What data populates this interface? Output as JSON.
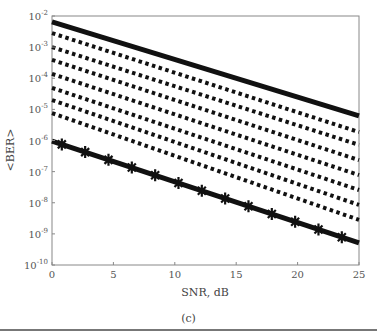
{
  "chart_data": {
    "type": "line",
    "title": "",
    "xlabel": "SNR, dB",
    "ylabel": "<BER>",
    "caption": "(c)",
    "xlim": [
      0,
      25
    ],
    "ylim": [
      1e-10,
      0.01
    ],
    "yscale": "log",
    "grid": false,
    "legend": null,
    "x_ticks": [
      0,
      5,
      10,
      15,
      20,
      25
    ],
    "y_ticks": [
      "10^-2",
      "10^-3",
      "10^-4",
      "10^-5",
      "10^-6",
      "10^-7",
      "10^-8",
      "10^-9",
      "10^-10"
    ],
    "x": [
      0,
      25
    ],
    "series": [
      {
        "name": "curve-1 (solid, top)",
        "style": "solid",
        "log10_values": [
          -2.19,
          -5.21
        ]
      },
      {
        "name": "curve-2 (dotted)",
        "style": "dotted",
        "log10_values": [
          -2.55,
          -5.73
        ]
      },
      {
        "name": "curve-3 (dotted)",
        "style": "dotted",
        "log10_values": [
          -3.0,
          -6.14
        ]
      },
      {
        "name": "curve-4 (dotted)",
        "style": "dotted",
        "log10_values": [
          -3.41,
          -6.63
        ]
      },
      {
        "name": "curve-5 (dotted)",
        "style": "dotted",
        "log10_values": [
          -3.86,
          -7.11
        ]
      },
      {
        "name": "curve-6 (dotted)",
        "style": "dotted",
        "log10_values": [
          -4.31,
          -7.59
        ]
      },
      {
        "name": "curve-7 (dotted)",
        "style": "dotted",
        "log10_values": [
          -4.7,
          -8.07
        ]
      },
      {
        "name": "curve-8 (dotted)",
        "style": "dotted",
        "log10_values": [
          -5.12,
          -8.55
        ]
      },
      {
        "name": "curve-9 (solid with star markers, bottom)",
        "style": "solid-marker",
        "log10_values": [
          -6.02,
          -9.29
        ]
      }
    ]
  },
  "labels": {
    "xlabel": "SNR, dB",
    "ylabel": "<BER>",
    "caption": "(c)"
  }
}
